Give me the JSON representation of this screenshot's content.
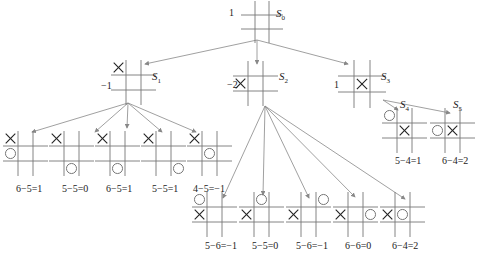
{
  "colors": {
    "grid": "#777777",
    "marks": "#222222",
    "arrows": "#888888",
    "background": "#ffffff"
  },
  "root": {
    "name": "S",
    "sub": "0",
    "value": "1"
  },
  "level1": [
    {
      "name": "S",
      "sub": "1",
      "value": "−1",
      "x_cell": "top-left"
    },
    {
      "name": "S",
      "sub": "2",
      "value": "−2",
      "x_cell": "middle-left"
    },
    {
      "name": "S",
      "sub": "3",
      "value": "1",
      "x_cell": "center"
    }
  ],
  "s1_children": [
    {
      "eval": "6−5=1",
      "x": "top-left",
      "o": "middle-left"
    },
    {
      "eval": "5−5=0",
      "x": "top-left",
      "o": "bottom-middle"
    },
    {
      "eval": "6−5=1",
      "x": "top-left",
      "o": "bottom-middle"
    },
    {
      "eval": "5−5=1",
      "x": "top-left",
      "o": "bottom-right"
    },
    {
      "eval": "4−5=−1",
      "x": "top-left",
      "o": "center"
    }
  ],
  "s2_children": [
    {
      "eval": "5−6=−1",
      "x": "middle-left",
      "o": "top-left"
    },
    {
      "eval": "5−5=0",
      "x": "middle-left",
      "o": "top-middle"
    },
    {
      "eval": "5−6=−1",
      "x": "middle-left",
      "o": "top-right"
    },
    {
      "eval": "6−6=0",
      "x": "middle-left",
      "o": "middle-right"
    },
    {
      "eval": "6−4=2",
      "x": "middle-left",
      "o": "center"
    }
  ],
  "s3_children": [
    {
      "name": "S",
      "sub": "4",
      "eval": "5−4=1",
      "x": "center",
      "o": "top-left"
    },
    {
      "name": "S",
      "sub": "5",
      "eval": "6−4=2",
      "x": "center",
      "o": "middle-left"
    }
  ]
}
